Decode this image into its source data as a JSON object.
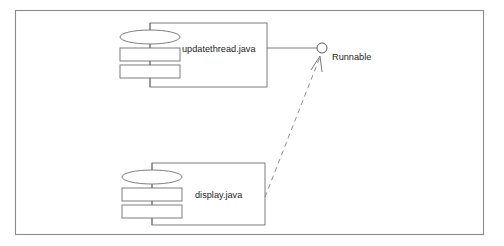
{
  "diagram": {
    "type": "uml-component-diagram",
    "frame": {
      "name": "diagram-frame",
      "x": 15,
      "y": 10,
      "width": 469,
      "height": 225
    },
    "colors": {
      "background": "#ffffff",
      "frame_stroke": "#8a8a8a",
      "shape_stroke": "#6f6f6f",
      "dashed_stroke": "#8f8f8f",
      "text": "#1d1d1d"
    },
    "components": [
      {
        "id": "updatethread",
        "label": "updatethread.java",
        "body": {
          "x": 150,
          "y": 23,
          "width": 117,
          "height": 64
        },
        "label_x": 182,
        "label_y": 50,
        "ellipse": {
          "cx": 150,
          "cy": 37,
          "rx": 30,
          "ry": 7
        },
        "tabs": [
          {
            "x": 120,
            "y": 48,
            "width": 60,
            "height": 13
          },
          {
            "x": 120,
            "y": 65,
            "width": 60,
            "height": 13
          }
        ],
        "spine": {
          "x": 150,
          "y1": 23,
          "y2": 87
        }
      },
      {
        "id": "display",
        "label": "display.java",
        "body": {
          "x": 152,
          "y": 163,
          "width": 113,
          "height": 62
        },
        "label_x": 195,
        "label_y": 196,
        "ellipse": {
          "cx": 152,
          "cy": 177,
          "rx": 30,
          "ry": 7
        },
        "tabs": [
          {
            "x": 122,
            "y": 188,
            "width": 60,
            "height": 13
          },
          {
            "x": 122,
            "y": 205,
            "width": 60,
            "height": 13
          }
        ],
        "spine": {
          "x": 152,
          "y1": 163,
          "y2": 225
        }
      }
    ],
    "interfaces": [
      {
        "id": "runnable",
        "label": "Runnable",
        "circle": {
          "cx": 322,
          "cy": 48,
          "r": 5
        },
        "label_x": 332,
        "label_y": 58,
        "provided_by": "updatethread",
        "connector": {
          "x1": 267,
          "y1": 48,
          "x2": 317,
          "y2": 48
        }
      }
    ],
    "relationships": [
      {
        "id": "display-realizes-runnable",
        "kind": "realization",
        "source": "display",
        "target": "runnable",
        "line": {
          "x1": 265,
          "y1": 197,
          "x2": 320,
          "y2": 57
        },
        "arrowhead": "open-v"
      }
    ]
  }
}
